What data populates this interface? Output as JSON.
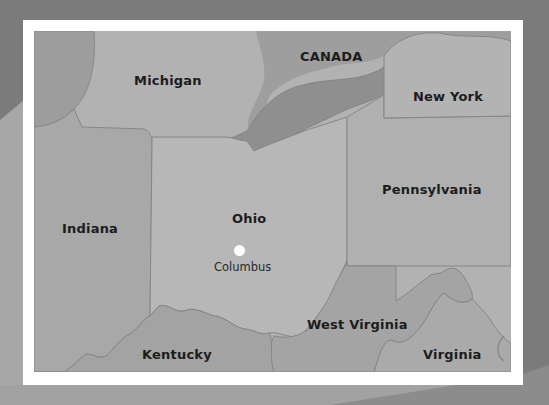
{
  "map": {
    "title": "Ohio and surrounding region",
    "regions": [
      {
        "id": "michigan",
        "label": "Michigan"
      },
      {
        "id": "canada",
        "label": "CANADA"
      },
      {
        "id": "new-york",
        "label": "New York"
      },
      {
        "id": "pennsylvania",
        "label": "Pennsylvania"
      },
      {
        "id": "indiana",
        "label": "Indiana"
      },
      {
        "id": "ohio",
        "label": "Ohio"
      },
      {
        "id": "west-virginia",
        "label": "West Virginia"
      },
      {
        "id": "kentucky",
        "label": "Kentucky"
      },
      {
        "id": "virginia",
        "label": "Virginia"
      }
    ],
    "cities": [
      {
        "id": "columbus",
        "label": "Columbus",
        "marker": "white-dot"
      }
    ],
    "colors": {
      "background": "#7b7b7b",
      "frame": "#ffffff",
      "land_light": "#b4b4b4",
      "land_mid": "#a6a6a6",
      "water": "#8f8f8f",
      "canada": "#9c9c9c",
      "border": "#7e7e7e",
      "label": "#1c1c1c",
      "city_marker": "#ffffff"
    }
  }
}
